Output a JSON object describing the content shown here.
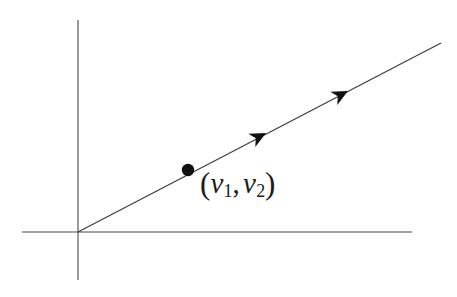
{
  "figure": {
    "type": "vector-line-diagram",
    "background_color": "#ffffff",
    "stroke_color": "#3a3a3a",
    "ink_color": "#1b1b1b",
    "width": 457,
    "height": 297
  },
  "axes": {
    "origin": {
      "x": 78,
      "y": 232
    },
    "x_axis": {
      "name": "horizontal-axis",
      "x1": 22,
      "y1": 232,
      "x2": 412,
      "y2": 232,
      "stroke_width": 1.1,
      "color": "#4a4a4a"
    },
    "y_axis": {
      "name": "vertical-axis",
      "x1": 78,
      "y1": 20,
      "x2": 78,
      "y2": 280,
      "stroke_width": 1.1,
      "color": "#4a4a4a"
    }
  },
  "line": {
    "name": "direction-line",
    "x1": 78,
    "y1": 232,
    "x2": 441,
    "y2": 43,
    "slope": -0.52,
    "stroke_width": 1.1,
    "color": "#3a3a3a"
  },
  "arrowheads": [
    {
      "name": "arrowhead-lower",
      "x": 266,
      "y": 133,
      "angle_deg": -27.5,
      "size": 15
    },
    {
      "name": "arrowhead-upper",
      "x": 348,
      "y": 91,
      "angle_deg": -27.5,
      "size": 15
    }
  ],
  "point": {
    "name": "vector-point",
    "x": 188,
    "y": 170,
    "radius": 6.2,
    "color": "#111111",
    "label": {
      "open_paren": "(",
      "var1": "v",
      "sub1": "1",
      "comma": ",",
      "var2": "v",
      "sub2": "2",
      "close_paren": ")",
      "full_text": "(v1, v2)"
    }
  }
}
